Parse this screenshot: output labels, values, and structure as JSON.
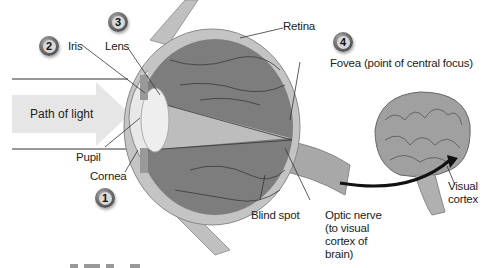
{
  "diagram": {
    "title_partial": "",
    "path_of_light": "Path of light",
    "labels": {
      "iris": "Iris",
      "lens": "Lens",
      "retina": "Retina",
      "fovea": "Fovea (point of central focus)",
      "pupil": "Pupil",
      "cornea": "Cornea",
      "blind_spot": "Blind spot",
      "optic_nerve_line1": "Optic nerve",
      "optic_nerve_line2": "(to visual",
      "optic_nerve_line3": "cortex of",
      "optic_nerve_line4": "brain)",
      "visual_cortex_line1": "Visual",
      "visual_cortex_line2": "cortex"
    },
    "badges": {
      "b1": "1",
      "b2": "2",
      "b3": "3",
      "b4": "4"
    },
    "colors": {
      "eye_interior": "#7a7a7a",
      "eye_wall": "#b8b8b8",
      "light_band": "#e6e6e6",
      "brain": "#9a9a9a",
      "text": "#222222"
    }
  }
}
